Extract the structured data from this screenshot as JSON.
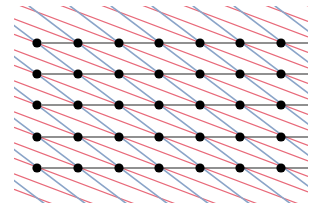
{
  "diagram": {
    "type": "lattice",
    "columns_x": [
      37,
      78,
      119,
      159,
      200,
      240,
      281
    ],
    "rows_y": [
      43,
      74,
      105,
      137,
      168
    ],
    "colors": {
      "dot": "#000000",
      "horizontal_line": "#222222",
      "blue_line": "#8aa4c8",
      "red_line": "#e86a7a",
      "green_accent": "#7fd87f"
    },
    "extent": {
      "x_min": 14,
      "x_max": 308,
      "y_min": 6,
      "y_max": 203
    }
  }
}
